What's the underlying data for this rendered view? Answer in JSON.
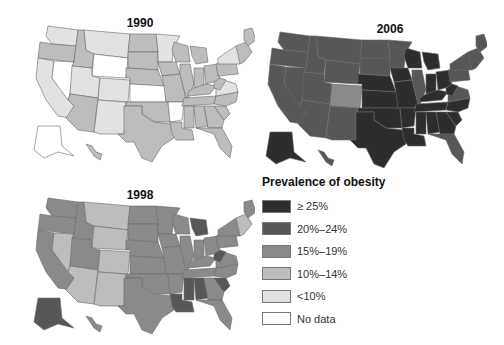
{
  "colors": {
    "ge25": "#2d2d2d",
    "p20_24": "#575757",
    "p15_19": "#8a8a8a",
    "p10_14": "#bdbdbd",
    "lt10": "#e2e2e2",
    "nodata": "#ffffff"
  },
  "maps": [
    {
      "title": "1990",
      "default_fill": "#bdbdbd",
      "states": {
        "WA": "#e2e2e2",
        "OR": "#bdbdbd",
        "CA": "#e2e2e2",
        "NV": "#ffffff",
        "ID": "#bdbdbd",
        "MT": "#e2e2e2",
        "WY": "#ffffff",
        "UT": "#e2e2e2",
        "CO": "#e2e2e2",
        "AZ": "#bdbdbd",
        "NM": "#e2e2e2",
        "ND": "#bdbdbd",
        "SD": "#bdbdbd",
        "NE": "#bdbdbd",
        "KS": "#ffffff",
        "OK": "#bdbdbd",
        "TX": "#bdbdbd",
        "MN": "#e2e2e2",
        "IA": "#bdbdbd",
        "MO": "#bdbdbd",
        "AR": "#ffffff",
        "LA": "#bdbdbd",
        "WI": "#bdbdbd",
        "IL": "#bdbdbd",
        "MI": "#bdbdbd",
        "IN": "#bdbdbd",
        "OH": "#bdbdbd",
        "KY": "#bdbdbd",
        "TN": "#bdbdbd",
        "MS": "#bdbdbd",
        "AL": "#bdbdbd",
        "GA": "#bdbdbd",
        "FL": "#bdbdbd",
        "SC": "#bdbdbd",
        "NC": "#bdbdbd",
        "VA": "#e2e2e2",
        "WV": "#bdbdbd",
        "PA": "#bdbdbd",
        "NY": "#e2e2e2",
        "NE_states": "#bdbdbd",
        "ME": "#bdbdbd",
        "AK": "#ffffff",
        "HI": "#bdbdbd"
      }
    },
    {
      "title": "2006",
      "default_fill": "#575757",
      "states": {
        "WA": "#575757",
        "OR": "#575757",
        "CA": "#575757",
        "NV": "#575757",
        "ID": "#575757",
        "MT": "#575757",
        "WY": "#575757",
        "UT": "#575757",
        "CO": "#8a8a8a",
        "AZ": "#575757",
        "NM": "#575757",
        "ND": "#575757",
        "SD": "#575757",
        "NE": "#2d2d2d",
        "KS": "#2d2d2d",
        "OK": "#2d2d2d",
        "TX": "#2d2d2d",
        "MN": "#575757",
        "IA": "#2d2d2d",
        "MO": "#2d2d2d",
        "AR": "#2d2d2d",
        "LA": "#2d2d2d",
        "WI": "#2d2d2d",
        "IL": "#575757",
        "MI": "#2d2d2d",
        "IN": "#2d2d2d",
        "OH": "#2d2d2d",
        "KY": "#2d2d2d",
        "TN": "#2d2d2d",
        "MS": "#2d2d2d",
        "AL": "#2d2d2d",
        "GA": "#2d2d2d",
        "FL": "#575757",
        "SC": "#2d2d2d",
        "NC": "#2d2d2d",
        "VA": "#575757",
        "WV": "#2d2d2d",
        "PA": "#575757",
        "NY": "#575757",
        "NE_states": "#575757",
        "ME": "#575757",
        "AK": "#2d2d2d",
        "HI": "#575757"
      }
    },
    {
      "title": "1998",
      "default_fill": "#8a8a8a",
      "states": {
        "WA": "#8a8a8a",
        "OR": "#8a8a8a",
        "CA": "#8a8a8a",
        "NV": "#bdbdbd",
        "ID": "#8a8a8a",
        "MT": "#bdbdbd",
        "WY": "#bdbdbd",
        "UT": "#8a8a8a",
        "CO": "#bdbdbd",
        "AZ": "#bdbdbd",
        "NM": "#bdbdbd",
        "ND": "#8a8a8a",
        "SD": "#8a8a8a",
        "NE": "#8a8a8a",
        "KS": "#8a8a8a",
        "OK": "#8a8a8a",
        "TX": "#8a8a8a",
        "MN": "#8a8a8a",
        "IA": "#8a8a8a",
        "MO": "#8a8a8a",
        "AR": "#8a8a8a",
        "LA": "#575757",
        "WI": "#8a8a8a",
        "IL": "#8a8a8a",
        "MI": "#575757",
        "IN": "#8a8a8a",
        "OH": "#8a8a8a",
        "KY": "#8a8a8a",
        "TN": "#8a8a8a",
        "MS": "#575757",
        "AL": "#575757",
        "GA": "#8a8a8a",
        "FL": "#8a8a8a",
        "SC": "#575757",
        "NC": "#8a8a8a",
        "VA": "#8a8a8a",
        "WV": "#575757",
        "PA": "#8a8a8a",
        "NY": "#8a8a8a",
        "NE_states": "#bdbdbd",
        "ME": "#8a8a8a",
        "AK": "#575757",
        "HI": "#8a8a8a"
      }
    }
  ],
  "legend": {
    "title": "Prevalence of obesity",
    "items": [
      {
        "label": "≥ 25%",
        "color": "#2d2d2d"
      },
      {
        "label": "20%–24%",
        "color": "#575757"
      },
      {
        "label": "15%–19%",
        "color": "#8a8a8a"
      },
      {
        "label": "10%–14%",
        "color": "#bdbdbd"
      },
      {
        "label": "<10%",
        "color": "#e2e2e2"
      },
      {
        "label": "No data",
        "color": "#ffffff"
      }
    ]
  }
}
